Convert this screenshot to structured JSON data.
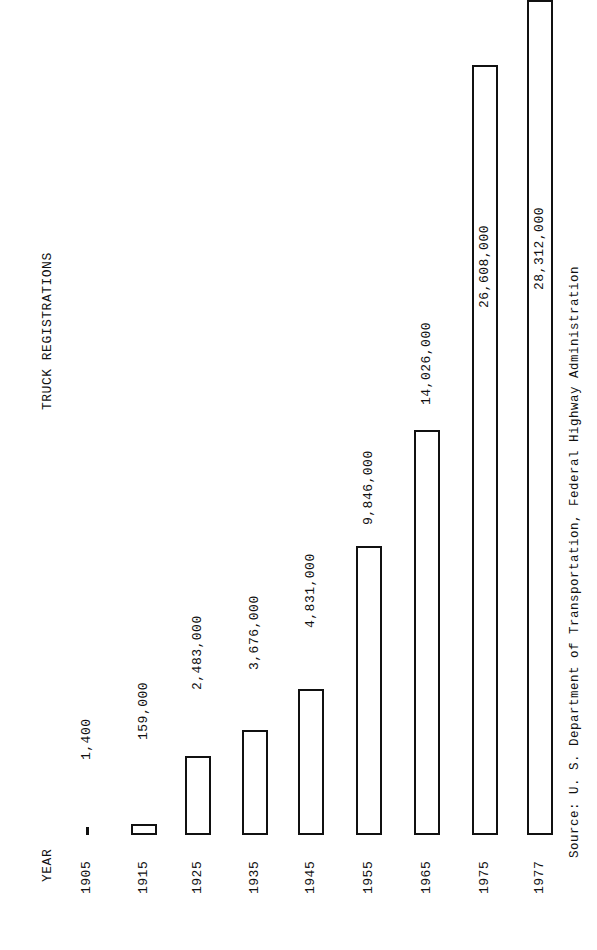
{
  "chart_data": {
    "type": "bar",
    "orientation": "rotated-90",
    "title": "TRUCK REGISTRATIONS",
    "xlabel": "YEAR",
    "ylabel": "",
    "categories": [
      "1905",
      "1915",
      "1925",
      "1935",
      "1945",
      "1955",
      "1965",
      "1975",
      "1977"
    ],
    "values": [
      1400,
      159000,
      2483000,
      3676000,
      4831000,
      9846000,
      14026000,
      26608000,
      28312000
    ],
    "value_labels": [
      "1,400",
      "159,000",
      "2,483,000",
      "3,676,000",
      "4,831,000",
      "9,846,000",
      "14,026,000",
      "26,608,000",
      "28,312,000"
    ],
    "source": "Source:  U. S. Department of Transportation, Federal Highway Administration",
    "grid": false,
    "legend": null
  },
  "layout": {
    "baseline_y": 835,
    "bar_width": 26,
    "centers_x": [
      87,
      144,
      198,
      255,
      311,
      369,
      427,
      485,
      540
    ],
    "tops_y": [
      833,
      824,
      756,
      730,
      689,
      546,
      430,
      65,
      0
    ],
    "label_bottom_y": [
      760,
      740,
      690,
      670,
      628,
      525,
      405,
      308,
      290
    ],
    "label_inside": [
      false,
      false,
      false,
      false,
      false,
      false,
      false,
      true,
      true
    ],
    "stroke_color": "#111111",
    "background": "#ffffff"
  }
}
